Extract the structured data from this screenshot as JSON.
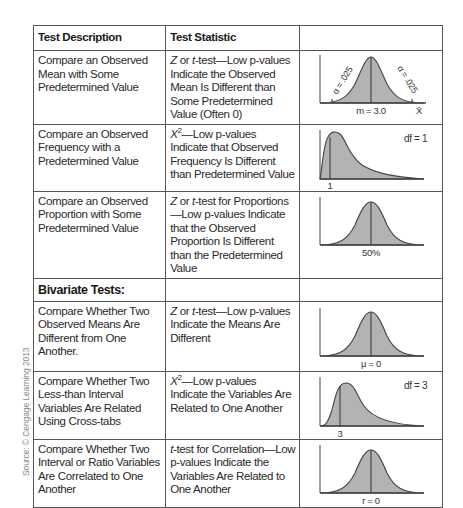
{
  "source_note": "Source: © Cengage Learning 2013",
  "header": {
    "col1": "Test Description",
    "col2": "Test Statistic",
    "col3": ""
  },
  "rows": [
    {
      "description": "Compare an Observed Mean with Some Predetermined Value",
      "stat_prefix": "Z",
      "stat_mid": " or ",
      "stat_prefix2": "t",
      "stat_text": "-test—Low p-values Indicate the Observed Mean Is Different than Some Predetermined Value (Often 0)",
      "chart": {
        "type": "normal-two-tailed",
        "center_label": "m = 3.0",
        "axis_label": "X̄",
        "left_tail_label": "α = .025",
        "right_tail_label": "α = .025"
      }
    },
    {
      "description": "Compare an Observed Frequency with a Predetermined Value",
      "stat_prefix": "X",
      "stat_sup": "2",
      "stat_text": "—Low p-values Indicate that Observed Frequency Is Different than Predetermined Value",
      "chart": {
        "type": "chi-square",
        "marker_label": "1",
        "df_label": "df = 1"
      }
    },
    {
      "description": "Compare an Observed Proportion with Some Predetermined Value",
      "stat_prefix": "Z",
      "stat_mid": " or ",
      "stat_prefix2": "t",
      "stat_text": "-test for Proportions—Low p-values Indicate that the Observed Proportion Is Different than the Predetermined Value",
      "chart": {
        "type": "normal",
        "center_label": "50%"
      }
    }
  ],
  "section": {
    "label": "Bivariate Tests:"
  },
  "bivariate_rows": [
    {
      "description": "Compare Whether Two Observed Means Are Different from One Another.",
      "stat_prefix": "Z",
      "stat_mid": " or ",
      "stat_prefix2": "t",
      "stat_text": "-test—Low p-values Indicate the Means Are Different",
      "chart": {
        "type": "normal",
        "center_label": "μ = 0"
      }
    },
    {
      "description": "Compare Whether Two Less-than Interval Variables Are Related Using Cross-tabs",
      "stat_prefix": "X",
      "stat_sup": "2",
      "stat_text": "—Low p-values Indicate the Variables Are Related to One Another",
      "chart": {
        "type": "chi-square",
        "marker_label": "3",
        "df_label": "df = 3"
      }
    },
    {
      "description": "Compare Whether Two Interval or Ratio Variables Are Correlated to One Another",
      "stat_prefix2": "t",
      "stat_text": "-test for Correlation—Low p-values Indicate the Variables Are Related to One Another",
      "chart": {
        "type": "normal",
        "center_label": "r = 0"
      }
    }
  ],
  "colors": {
    "border": "#555555",
    "curve_fill": "#b3b3b3",
    "curve_stroke": "#444444",
    "text": "#2a2a2a",
    "source_text": "#8a8a8a"
  }
}
